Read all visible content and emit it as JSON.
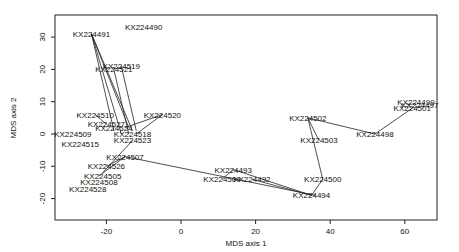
{
  "chart_data": {
    "type": "scatter",
    "title": "",
    "xlabel": "MDS axis 1",
    "ylabel": "MDS axis 2",
    "xlim": [
      -34,
      68
    ],
    "ylim": [
      -26,
      37
    ],
    "xticks": [
      -20,
      0,
      20,
      40,
      60
    ],
    "yticks": [
      -20,
      -10,
      0,
      10,
      20,
      30
    ],
    "grid": false,
    "legend": null,
    "points": [
      {
        "label": "KX224490",
        "x": -10,
        "y": 33
      },
      {
        "label": "KX224491",
        "x": -24,
        "y": 31
      },
      {
        "label": "KX224519",
        "x": -16,
        "y": 21
      },
      {
        "label": "KX224521",
        "x": -18,
        "y": 20
      },
      {
        "label": "KX224510",
        "x": -23,
        "y": 6
      },
      {
        "label": "KX224520",
        "x": -5,
        "y": 6
      },
      {
        "label": "KX224524",
        "x": -18,
        "y": 2
      },
      {
        "label": "KX224527",
        "x": -20,
        "y": 3
      },
      {
        "label": "KX224509",
        "x": -29,
        "y": 0
      },
      {
        "label": "KX224518",
        "x": -13,
        "y": 0
      },
      {
        "label": "KX224523",
        "x": -13,
        "y": -2
      },
      {
        "label": "KX224515",
        "x": -27,
        "y": -3
      },
      {
        "label": "KX224507",
        "x": -15,
        "y": -7
      },
      {
        "label": "KX224526",
        "x": -20,
        "y": -10
      },
      {
        "label": "KX224505",
        "x": -21,
        "y": -13
      },
      {
        "label": "KX224508",
        "x": -22,
        "y": -15
      },
      {
        "label": "KX224528",
        "x": -25,
        "y": -17
      },
      {
        "label": "KX224493",
        "x": 14,
        "y": -11
      },
      {
        "label": "KX224504",
        "x": 11,
        "y": -14
      },
      {
        "label": "KX224492",
        "x": 19,
        "y": -14
      },
      {
        "label": "KX224494",
        "x": 35,
        "y": -19
      },
      {
        "label": "KX224500",
        "x": 38,
        "y": -14
      },
      {
        "label": "KX224502",
        "x": 34,
        "y": 5
      },
      {
        "label": "KX224503",
        "x": 37,
        "y": -2
      },
      {
        "label": "KX224498",
        "x": 52,
        "y": 0
      },
      {
        "label": "KX224501",
        "x": 62,
        "y": 8
      },
      {
        "label": "KX224497",
        "x": 64,
        "y": 9
      },
      {
        "label": "KX224499",
        "x": 63,
        "y": 10
      }
    ],
    "segments": [
      [
        [
          -24,
          31
        ],
        [
          -13,
          1
        ]
      ],
      [
        [
          -24,
          31
        ],
        [
          -16,
          0
        ]
      ],
      [
        [
          -24,
          31
        ],
        [
          -18,
          1
        ]
      ],
      [
        [
          -24,
          31
        ],
        [
          -14,
          2
        ]
      ],
      [
        [
          -16,
          21
        ],
        [
          -12,
          1
        ]
      ],
      [
        [
          -18,
          20
        ],
        [
          -14,
          0
        ]
      ],
      [
        [
          -23,
          6
        ],
        [
          -20,
          3
        ]
      ],
      [
        [
          -5,
          6
        ],
        [
          -15,
          2
        ]
      ],
      [
        [
          -5,
          6
        ],
        [
          -12,
          0
        ]
      ],
      [
        [
          -15,
          -7
        ],
        [
          -20,
          -10
        ]
      ],
      [
        [
          -15,
          -7
        ],
        [
          -22,
          -13
        ]
      ],
      [
        [
          -13,
          -2
        ],
        [
          -21,
          -12
        ]
      ],
      [
        [
          -15,
          -7
        ],
        [
          36,
          -19
        ]
      ],
      [
        [
          11,
          -14
        ],
        [
          14,
          -11
        ]
      ],
      [
        [
          14,
          -11
        ],
        [
          35,
          -19
        ]
      ],
      [
        [
          19,
          -14
        ],
        [
          35,
          -19
        ]
      ],
      [
        [
          35,
          -19
        ],
        [
          38,
          -14
        ]
      ],
      [
        [
          38,
          -14
        ],
        [
          34,
          5
        ]
      ],
      [
        [
          34,
          5
        ],
        [
          37,
          -2
        ]
      ],
      [
        [
          34,
          5
        ],
        [
          52,
          0
        ]
      ],
      [
        [
          52,
          0
        ],
        [
          62,
          8
        ]
      ]
    ]
  }
}
